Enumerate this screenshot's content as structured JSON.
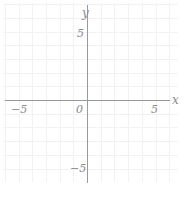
{
  "figure": {
    "width": 187,
    "height": 198,
    "background": "#ffffff",
    "grid_color": "#f2f2f2",
    "axis_color": "#9a9a9a",
    "label_color": "#8c8c8c"
  },
  "axes": {
    "x_axis_name": "x",
    "y_axis_name": "y",
    "origin_label": "0",
    "x_ticks": [
      {
        "value": -5,
        "label": "−5"
      },
      {
        "value": 5,
        "label": "5"
      }
    ],
    "y_ticks": [
      {
        "value": 5,
        "label": "5"
      },
      {
        "value": -5,
        "label": "−5"
      }
    ]
  },
  "chart_data": {
    "type": "scatter",
    "title": "",
    "subtitle": "",
    "xlabel": "x",
    "ylabel": "y",
    "xlim": [
      -6,
      6.5
    ],
    "ylim": [
      -6,
      6.5
    ],
    "xticks": [
      -5,
      5
    ],
    "xticklabels": [
      "−5",
      "5"
    ],
    "yticks": [
      -5,
      5
    ],
    "yticklabels": [
      "5",
      "−5"
    ],
    "origin_label": "0",
    "grid": true,
    "grid_spacing": 1,
    "grid_color": "#f2f2f2",
    "legend": false,
    "legend_position": "none",
    "annotations": [],
    "series": [
      {
        "name": "",
        "x": [],
        "y": []
      }
    ],
    "note": "Empty Cartesian coordinate plane — blank graph paper with axes labeled x and y, ticks at ±5, origin marked 0. No data plotted."
  }
}
